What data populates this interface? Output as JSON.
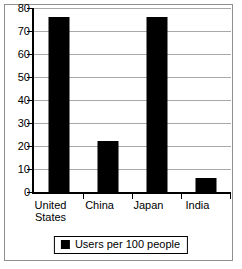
{
  "chart_data": {
    "type": "bar",
    "title": "",
    "xlabel": "",
    "ylabel": "",
    "categories": [
      "United States",
      "China",
      "Japan",
      "India"
    ],
    "category_lines": [
      [
        "United",
        "States"
      ],
      [
        "China"
      ],
      [
        "Japan"
      ],
      [
        "India"
      ]
    ],
    "values": [
      76,
      22,
      76,
      6
    ],
    "series": [
      {
        "name": "Users per 100 people",
        "values": [
          76,
          22,
          76,
          6
        ]
      }
    ],
    "ylim": [
      0,
      80
    ],
    "ytick_step": 10,
    "yticks": [
      80,
      70,
      60,
      50,
      40,
      30,
      20,
      10,
      0
    ],
    "ytick_labels": [
      "80",
      "70",
      "60",
      "50",
      "40",
      "30",
      "20",
      "10",
      "0"
    ],
    "grid": true,
    "legend_position": "bottom-center",
    "legend": [
      {
        "label": "Users per 100 people",
        "marker": "square",
        "color": "#000000"
      }
    ],
    "colors": {
      "bar": "#000000",
      "gridline": "#a8a8a8",
      "axis": "#000000",
      "background": "#ffffff",
      "frame": "#8f8f8f"
    }
  }
}
